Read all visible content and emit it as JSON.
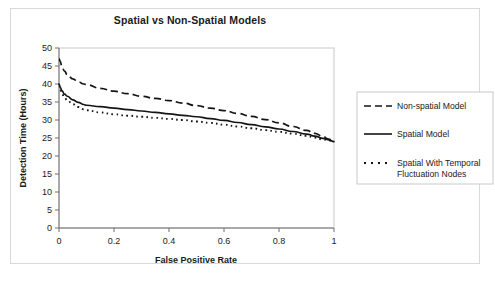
{
  "chart_data": {
    "type": "line",
    "title": "Spatial vs Non-Spatial Models",
    "xlabel": "False Positive Rate",
    "ylabel": "Detection Time (Hours)",
    "xlim": [
      0,
      1
    ],
    "ylim": [
      0,
      50
    ],
    "xticks": [
      "0",
      "0.2",
      "0.4",
      "0.6",
      "0.8",
      "1"
    ],
    "xtick_values": [
      0,
      0.2,
      0.4,
      0.6,
      0.8,
      1
    ],
    "yticks": [
      "0",
      "5",
      "10",
      "15",
      "20",
      "25",
      "30",
      "35",
      "40",
      "45",
      "50"
    ],
    "ytick_values": [
      0,
      5,
      10,
      15,
      20,
      25,
      30,
      35,
      40,
      45,
      50
    ],
    "grid": false,
    "legend_position": "right",
    "x": [
      0,
      0.005,
      0.01,
      0.02,
      0.03,
      0.05,
      0.07,
      0.09,
      0.1,
      0.15,
      0.2,
      0.25,
      0.3,
      0.35,
      0.4,
      0.45,
      0.5,
      0.55,
      0.6,
      0.65,
      0.7,
      0.75,
      0.8,
      0.85,
      0.9,
      0.93,
      0.96,
      0.98,
      1
    ],
    "series": [
      {
        "name": "Non-spatial Model",
        "style": "dashed",
        "values": [
          47.0,
          46.2,
          45.0,
          43.6,
          42.6,
          41.4,
          40.6,
          40.0,
          39.8,
          38.8,
          38.0,
          37.3,
          36.6,
          36.0,
          35.4,
          34.7,
          34.0,
          33.3,
          32.6,
          31.8,
          31.0,
          30.1,
          29.2,
          28.2,
          27.1,
          26.3,
          25.4,
          24.7,
          24.0
        ]
      },
      {
        "name": "Spatial Model",
        "style": "solid",
        "values": [
          40.0,
          39.0,
          38.2,
          37.2,
          36.6,
          35.6,
          34.9,
          34.3,
          34.1,
          33.7,
          33.3,
          32.9,
          32.5,
          32.1,
          31.7,
          31.3,
          30.9,
          30.4,
          29.9,
          29.3,
          28.7,
          28.1,
          27.5,
          26.8,
          26.1,
          25.5,
          24.9,
          24.5,
          24.0
        ]
      },
      {
        "name": "Spatial With Temporal Fluctuation Nodes",
        "style": "dotted",
        "values": [
          39.6,
          38.4,
          37.4,
          36.2,
          35.5,
          34.4,
          33.6,
          33.0,
          32.7,
          32.1,
          31.6,
          31.2,
          30.9,
          30.6,
          30.3,
          30.0,
          29.6,
          29.2,
          28.7,
          28.2,
          27.7,
          27.2,
          26.7,
          26.2,
          25.6,
          25.1,
          24.6,
          24.3,
          24.0
        ]
      }
    ]
  },
  "legend": {
    "items": [
      {
        "label": "Non-spatial Model",
        "style": "dashed"
      },
      {
        "label": "Spatial Model",
        "style": "solid"
      },
      {
        "label": "Spatial With Temporal",
        "label2": "Fluctuation Nodes",
        "style": "dotted"
      }
    ]
  }
}
